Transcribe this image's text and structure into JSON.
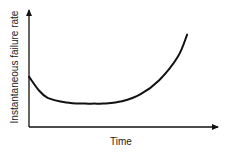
{
  "chart_data": {
    "type": "line",
    "title": "",
    "xlabel": "Time",
    "ylabel": "Instantaneous failure rate",
    "grid": false,
    "legend": null,
    "axis_ticks": false,
    "series": [
      {
        "name": "failure rate",
        "x": [
          0.0,
          0.05,
          0.1,
          0.2,
          0.3,
          0.35,
          0.4,
          0.5,
          0.6,
          0.7,
          0.8,
          0.85
        ],
        "y": [
          0.43,
          0.32,
          0.25,
          0.21,
          0.2,
          0.2,
          0.2,
          0.22,
          0.28,
          0.4,
          0.6,
          0.79
        ]
      }
    ],
    "xlim": [
      0,
      1
    ],
    "ylim": [
      0,
      1
    ]
  },
  "colors": {
    "line": "#111111",
    "axis": "#111111",
    "text": "#222222",
    "background": "#ffffff"
  }
}
